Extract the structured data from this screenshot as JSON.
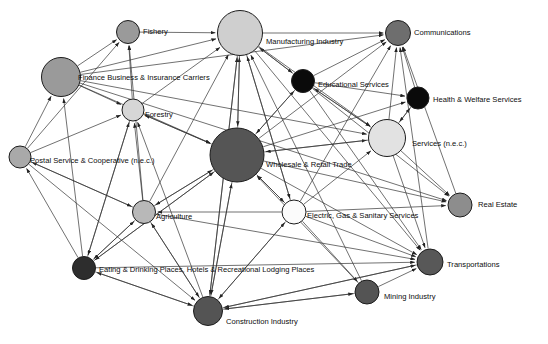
{
  "figure": {
    "type": "network-diagram",
    "title": "",
    "background_color": "#ffffff",
    "width": 548,
    "height": 344,
    "edge_color": "#333333",
    "node_stroke_color": "#1c1c1c",
    "label_color": "#0d0d0d",
    "label_font_size": 7.6,
    "directed": true
  },
  "nodes": [
    {
      "id": "fishery",
      "label": "Fishery",
      "x": 128,
      "y": 32,
      "r": 11.5,
      "color": "#9a9a9a",
      "label_x": 143,
      "label_y": 32,
      "anchor": "start"
    },
    {
      "id": "manufacturing",
      "label": "Manufacturing Industry",
      "x": 240,
      "y": 33,
      "r": 22.5,
      "color": "#cfcfcf",
      "label_x": 266,
      "label_y": 42,
      "anchor": "start"
    },
    {
      "id": "communications",
      "label": "Communications",
      "x": 398,
      "y": 33,
      "r": 12.5,
      "color": "#6e6e6e",
      "label_x": 414,
      "label_y": 33,
      "anchor": "start"
    },
    {
      "id": "finance",
      "label": "Finance Business & Insurance Carriers",
      "x": 61,
      "y": 77,
      "r": 19.5,
      "color": "#9a9a9a",
      "label_x": 78,
      "label_y": 78,
      "anchor": "start"
    },
    {
      "id": "education",
      "label": "Educational Services",
      "x": 303,
      "y": 81,
      "r": 11.5,
      "color": "#0a0a0a",
      "label_x": 318,
      "label_y": 85,
      "anchor": "start"
    },
    {
      "id": "health",
      "label": "Health & Welfare Services",
      "x": 418,
      "y": 98,
      "r": 11.0,
      "color": "#0a0a0a",
      "label_x": 433,
      "label_y": 100,
      "anchor": "start"
    },
    {
      "id": "forestry",
      "label": "Forestry",
      "x": 133,
      "y": 110,
      "r": 11.0,
      "color": "#d6d6d6",
      "label_x": 145,
      "label_y": 115,
      "anchor": "start"
    },
    {
      "id": "services_nec",
      "label": "Services (n.e.c.)",
      "x": 387,
      "y": 138,
      "r": 18.5,
      "color": "#e2e2e2",
      "label_x": 412,
      "label_y": 144,
      "anchor": "start"
    },
    {
      "id": "postal",
      "label": "Postal Service & Cooperative (n.e.c.)",
      "x": 20,
      "y": 157,
      "r": 11.0,
      "color": "#a9a9a9",
      "label_x": 30,
      "label_y": 161,
      "anchor": "start"
    },
    {
      "id": "wholesale",
      "label": "Wholesale & Retail Trade",
      "x": 237,
      "y": 155,
      "r": 27.0,
      "color": "#555555",
      "label_x": 266,
      "label_y": 165,
      "anchor": "start"
    },
    {
      "id": "real_estate",
      "label": "Real Estate",
      "x": 460,
      "y": 205,
      "r": 12.0,
      "color": "#8d8d8d",
      "label_x": 478,
      "label_y": 205,
      "anchor": "start"
    },
    {
      "id": "agriculture",
      "label": "Agriculture",
      "x": 144,
      "y": 212,
      "r": 11.5,
      "color": "#b8b8b8",
      "label_x": 156,
      "label_y": 217,
      "anchor": "start"
    },
    {
      "id": "electric",
      "label": "Electric, Gas & Sanitary Services",
      "x": 294,
      "y": 212,
      "r": 12.0,
      "color": "#fbfbfb",
      "label_x": 307,
      "label_y": 216,
      "anchor": "start"
    },
    {
      "id": "transportation",
      "label": "Transportations",
      "x": 430,
      "y": 262,
      "r": 13.0,
      "color": "#585858",
      "label_x": 447,
      "label_y": 265,
      "anchor": "start"
    },
    {
      "id": "eating",
      "label": "Eating & Drinking Places, Hotels & Recreational Lodging Places",
      "x": 84,
      "y": 268,
      "r": 11.5,
      "color": "#2d2d2d",
      "label_x": 99,
      "label_y": 270,
      "anchor": "start"
    },
    {
      "id": "mining",
      "label": "Mining Industry",
      "x": 367,
      "y": 292,
      "r": 12.0,
      "color": "#545454",
      "label_x": 384,
      "label_y": 297,
      "anchor": "start"
    },
    {
      "id": "construction",
      "label": "Construction Industry",
      "x": 208,
      "y": 311,
      "r": 14.5,
      "color": "#545454",
      "label_x": 226,
      "label_y": 322,
      "anchor": "start"
    }
  ],
  "edges": [
    {
      "from": "finance",
      "to": "fishery"
    },
    {
      "from": "postal",
      "to": "fishery"
    },
    {
      "from": "forestry",
      "to": "fishery"
    },
    {
      "from": "agriculture",
      "to": "fishery"
    },
    {
      "from": "fishery",
      "to": "manufacturing"
    },
    {
      "from": "finance",
      "to": "manufacturing"
    },
    {
      "from": "forestry",
      "to": "manufacturing"
    },
    {
      "from": "wholesale",
      "to": "manufacturing"
    },
    {
      "from": "education",
      "to": "manufacturing"
    },
    {
      "from": "agriculture",
      "to": "manufacturing"
    },
    {
      "from": "construction",
      "to": "manufacturing"
    },
    {
      "from": "electric",
      "to": "manufacturing"
    },
    {
      "from": "mining",
      "to": "manufacturing"
    },
    {
      "from": "manufacturing",
      "to": "communications"
    },
    {
      "from": "finance",
      "to": "communications"
    },
    {
      "from": "education",
      "to": "communications"
    },
    {
      "from": "wholesale",
      "to": "communications"
    },
    {
      "from": "services_nec",
      "to": "communications"
    },
    {
      "from": "health",
      "to": "communications"
    },
    {
      "from": "electric",
      "to": "communications"
    },
    {
      "from": "transportation",
      "to": "communications"
    },
    {
      "from": "real_estate",
      "to": "communications"
    },
    {
      "from": "postal",
      "to": "finance"
    },
    {
      "from": "eating",
      "to": "finance"
    },
    {
      "from": "wholesale",
      "to": "education"
    },
    {
      "from": "services_nec",
      "to": "education"
    },
    {
      "from": "manufacturing",
      "to": "education"
    },
    {
      "from": "education",
      "to": "health"
    },
    {
      "from": "services_nec",
      "to": "health"
    },
    {
      "from": "wholesale",
      "to": "health"
    },
    {
      "from": "finance",
      "to": "forestry"
    },
    {
      "from": "postal",
      "to": "forestry"
    },
    {
      "from": "agriculture",
      "to": "forestry"
    },
    {
      "from": "eating",
      "to": "forestry"
    },
    {
      "from": "construction",
      "to": "forestry"
    },
    {
      "from": "wholesale",
      "to": "forestry"
    },
    {
      "from": "education",
      "to": "services_nec"
    },
    {
      "from": "health",
      "to": "services_nec"
    },
    {
      "from": "wholesale",
      "to": "services_nec"
    },
    {
      "from": "manufacturing",
      "to": "services_nec"
    },
    {
      "from": "electric",
      "to": "services_nec"
    },
    {
      "from": "finance",
      "to": "services_nec"
    },
    {
      "from": "eating",
      "to": "postal"
    },
    {
      "from": "agriculture",
      "to": "postal"
    },
    {
      "from": "manufacturing",
      "to": "wholesale"
    },
    {
      "from": "education",
      "to": "wholesale"
    },
    {
      "from": "services_nec",
      "to": "wholesale"
    },
    {
      "from": "agriculture",
      "to": "wholesale"
    },
    {
      "from": "electric",
      "to": "wholesale"
    },
    {
      "from": "construction",
      "to": "wholesale"
    },
    {
      "from": "eating",
      "to": "wholesale"
    },
    {
      "from": "finance",
      "to": "wholesale"
    },
    {
      "from": "forestry",
      "to": "wholesale"
    },
    {
      "from": "mining",
      "to": "wholesale"
    },
    {
      "from": "wholesale",
      "to": "real_estate"
    },
    {
      "from": "services_nec",
      "to": "real_estate"
    },
    {
      "from": "electric",
      "to": "real_estate"
    },
    {
      "from": "finance",
      "to": "real_estate"
    },
    {
      "from": "education",
      "to": "real_estate"
    },
    {
      "from": "eating",
      "to": "agriculture"
    },
    {
      "from": "construction",
      "to": "agriculture"
    },
    {
      "from": "wholesale",
      "to": "agriculture"
    },
    {
      "from": "postal",
      "to": "agriculture"
    },
    {
      "from": "electric",
      "to": "agriculture"
    },
    {
      "from": "wholesale",
      "to": "electric"
    },
    {
      "from": "construction",
      "to": "electric"
    },
    {
      "from": "manufacturing",
      "to": "electric"
    },
    {
      "from": "electric",
      "to": "transportation"
    },
    {
      "from": "wholesale",
      "to": "transportation"
    },
    {
      "from": "mining",
      "to": "transportation"
    },
    {
      "from": "manufacturing",
      "to": "transportation"
    },
    {
      "from": "construction",
      "to": "transportation"
    },
    {
      "from": "agriculture",
      "to": "transportation"
    },
    {
      "from": "eating",
      "to": "transportation"
    },
    {
      "from": "services_nec",
      "to": "transportation"
    },
    {
      "from": "education",
      "to": "transportation"
    },
    {
      "from": "agriculture",
      "to": "eating"
    },
    {
      "from": "wholesale",
      "to": "eating"
    },
    {
      "from": "construction",
      "to": "eating"
    },
    {
      "from": "forestry",
      "to": "eating"
    },
    {
      "from": "electric",
      "to": "mining"
    },
    {
      "from": "construction",
      "to": "mining"
    },
    {
      "from": "eating",
      "to": "construction"
    },
    {
      "from": "agriculture",
      "to": "construction"
    },
    {
      "from": "wholesale",
      "to": "construction"
    },
    {
      "from": "electric",
      "to": "construction"
    },
    {
      "from": "mining",
      "to": "construction"
    },
    {
      "from": "manufacturing",
      "to": "construction"
    },
    {
      "from": "transportation",
      "to": "construction"
    },
    {
      "from": "postal",
      "to": "construction"
    }
  ]
}
